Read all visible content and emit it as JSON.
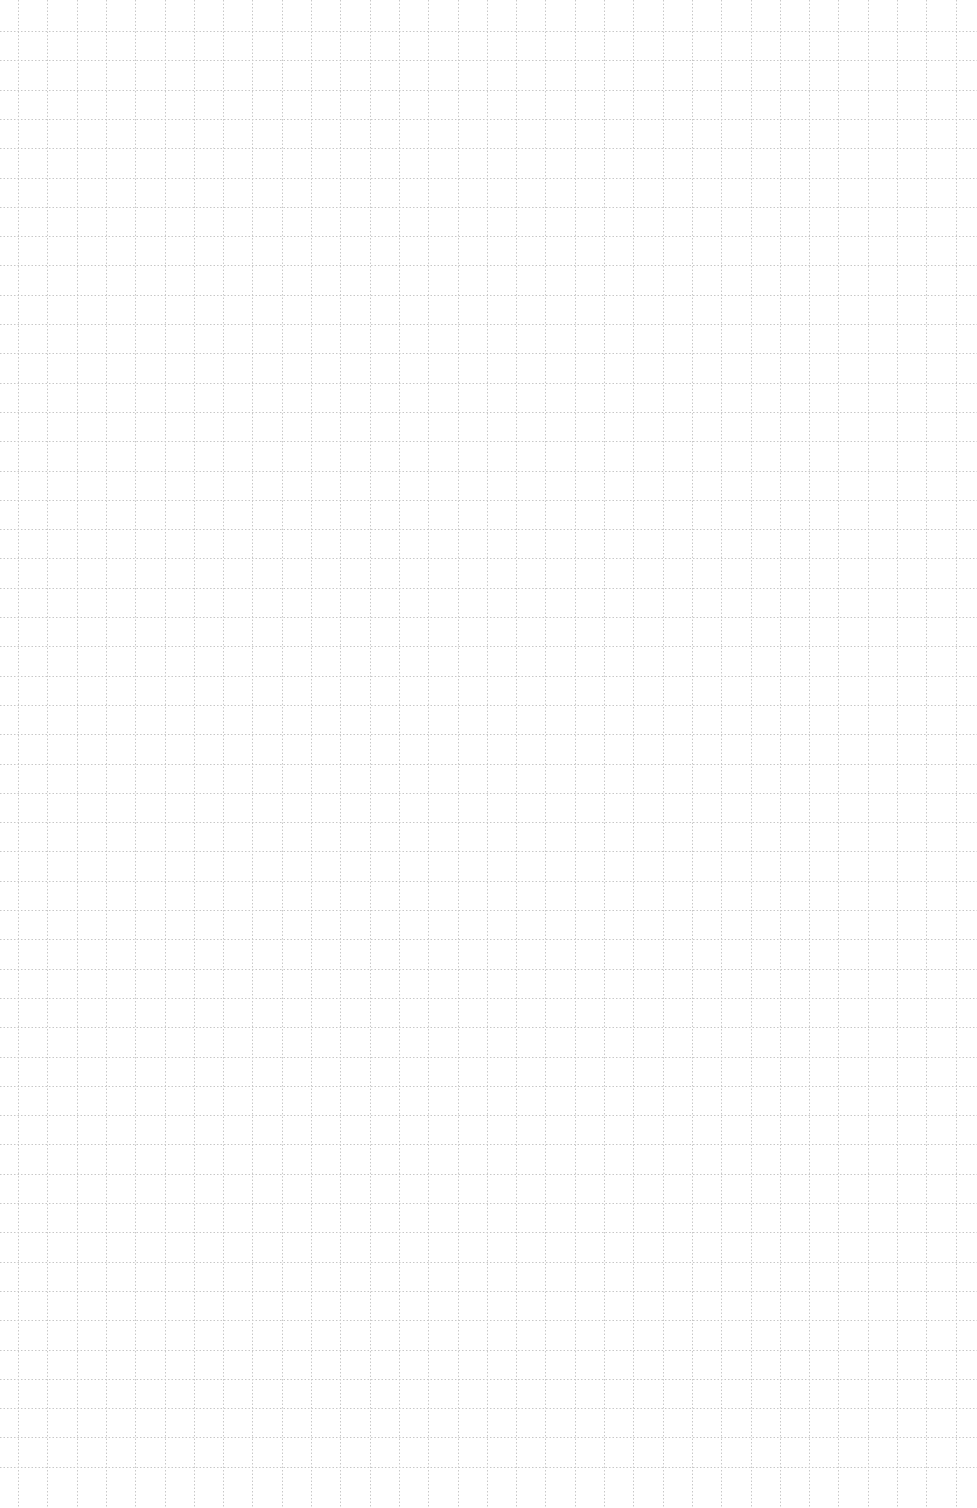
{
  "page": {
    "type": "graph-paper",
    "background_color": "#ffffff",
    "grid": {
      "line_color": "#c8c8c8",
      "line_style": "dotted",
      "spacing_px": 29.3,
      "first_vertical_x": 18,
      "first_horizontal_y": 31,
      "vertical_line_count": 33,
      "horizontal_line_count": 50
    }
  }
}
